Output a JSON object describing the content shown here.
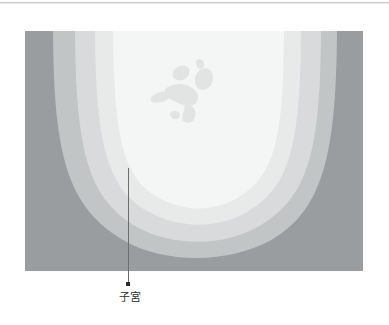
{
  "figure": {
    "name": "ultrasound-uterus-illustration",
    "annotation": {
      "label": "子宮",
      "leader_line_color": "#6d6d6d",
      "anchor_dot_color": "#2b2b2b"
    },
    "panel": {
      "width": 338,
      "height": 240,
      "layers": [
        {
          "name": "outer-tissue",
          "color": "#9a9d9f"
        },
        {
          "name": "myometrium-outer",
          "color": "#c2c5c6"
        },
        {
          "name": "myometrium-inner",
          "color": "#d8dadb"
        },
        {
          "name": "endometrial-cavity",
          "color": "#e8eaea"
        },
        {
          "name": "amniotic-fluid",
          "color": "#f4f5f5"
        }
      ],
      "fetus": {
        "name": "fetus-silhouette",
        "color": "#e2e4e4"
      }
    },
    "rule_color": "#c9ccd0"
  }
}
